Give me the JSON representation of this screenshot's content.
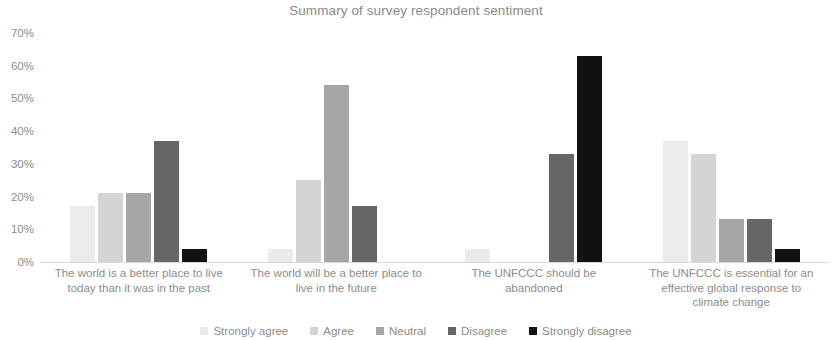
{
  "chart_data": {
    "type": "bar",
    "title": "Summary of survey respondent sentiment",
    "xlabel": "",
    "ylabel": "",
    "ylim": [
      0,
      70
    ],
    "ytick_labels": [
      "70%",
      "60%",
      "50%",
      "40%",
      "30%",
      "20%",
      "10%",
      "0%"
    ],
    "ytick_values": [
      70,
      60,
      50,
      40,
      30,
      20,
      10,
      0
    ],
    "grid": false,
    "legend_position": "bottom-center",
    "categories": [
      "The world is a better place to live today than it was in the past",
      "The world will be a better place to live in the future",
      "The UNFCCC should be abandoned",
      "The UNFCCC is essential for an effective global response to climate change"
    ],
    "category_lines": [
      [
        "The world is a better place to live",
        "today than it was in the past"
      ],
      [
        "The world will be a better place to",
        "live in the future"
      ],
      [
        "The UNFCCC should be",
        "abandoned"
      ],
      [
        "The UNFCCC is essential for an",
        "effective global response to",
        "climate change"
      ]
    ],
    "series": [
      {
        "name": "Strongly agree",
        "color": "#ebebeb",
        "values": [
          17,
          4,
          4,
          37
        ]
      },
      {
        "name": "Agree",
        "color": "#d4d4d4",
        "values": [
          21,
          25,
          0,
          33
        ]
      },
      {
        "name": "Neutral",
        "color": "#a6a6a6",
        "values": [
          21,
          54,
          0,
          13
        ]
      },
      {
        "name": "Disagree",
        "color": "#666666",
        "values": [
          37,
          17,
          33,
          13
        ]
      },
      {
        "name": "Strongly disagree",
        "color": "#111111",
        "values": [
          4,
          0,
          63,
          4
        ]
      }
    ]
  }
}
